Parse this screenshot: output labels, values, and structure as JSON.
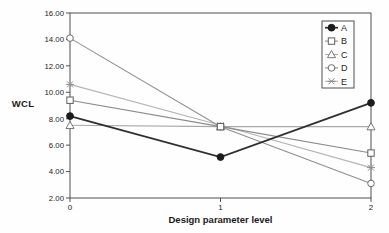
{
  "chart_data": {
    "type": "line",
    "title": "",
    "x_label": "Design parameter level",
    "y_label": "WCL",
    "x": [
      0,
      1,
      2
    ],
    "x_tick_labels": [
      "0",
      "1",
      "2"
    ],
    "ylim": [
      2,
      16
    ],
    "y_tick_values": [
      16,
      14,
      12,
      10,
      8,
      6,
      4,
      2
    ],
    "y_tick_labels": [
      "16.00",
      "14.00",
      "12.00",
      "10.00",
      "8.00",
      "6.00",
      "4.00",
      "2.00"
    ],
    "grid": false,
    "legend_position": "top-right-inside",
    "legend_labels": [
      "A",
      "B",
      "C",
      "D",
      "E"
    ],
    "axis_color": "#4f4f4f",
    "text_color": "#1d1d1d",
    "series": [
      {
        "name": "A",
        "values": [
          8.2,
          5.1,
          9.2
        ],
        "marker": "filled-circle",
        "line_color": "#2e2e2e",
        "marker_color": "#1c1c1c",
        "line_width": 1.7
      },
      {
        "name": "B",
        "values": [
          9.4,
          7.4,
          5.4
        ],
        "marker": "open-square",
        "line_color": "#8a8a8a",
        "marker_color": "#5f5f5f",
        "line_width": 1.1
      },
      {
        "name": "C",
        "values": [
          7.5,
          7.4,
          7.4
        ],
        "marker": "open-triangle",
        "line_color": "#a8a8a8",
        "marker_color": "#787878",
        "line_width": 1.1
      },
      {
        "name": "D",
        "values": [
          14.1,
          7.4,
          3.1
        ],
        "marker": "open-circle",
        "line_color": "#8f8f8f",
        "marker_color": "#6a6a6a",
        "line_width": 1.1
      },
      {
        "name": "E",
        "values": [
          10.6,
          7.5,
          4.3
        ],
        "marker": "asterisk",
        "line_color": "#b5b5b5",
        "marker_color": "#8d8d8d",
        "line_width": 1.1
      }
    ]
  }
}
